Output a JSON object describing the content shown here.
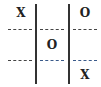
{
  "board": {
    "cells": [
      [
        "X",
        "",
        "O"
      ],
      [
        "",
        "O",
        ""
      ],
      [
        "",
        "",
        "X"
      ]
    ]
  },
  "colors": {
    "text": "#222222",
    "grid": "#333333",
    "highlight_separator": "#3a5a8a"
  }
}
